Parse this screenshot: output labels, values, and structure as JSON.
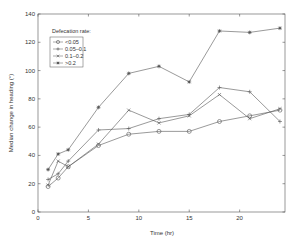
{
  "chart_data": {
    "type": "line",
    "title": "",
    "xlabel": "Time (hr)",
    "ylabel": "Median change in heading (°)",
    "xlim": [
      0,
      24.5
    ],
    "ylim": [
      0,
      140
    ],
    "xticks": [
      0,
      5,
      10,
      15,
      20
    ],
    "yticks": [
      0,
      20,
      40,
      60,
      80,
      100,
      120,
      140
    ],
    "grid": false,
    "legend_title": "Defecation rate:",
    "legend_position": "upper left",
    "x": [
      1,
      2,
      3,
      6,
      9,
      12,
      15,
      18,
      21,
      24
    ],
    "series": [
      {
        "name": "<0.05",
        "marker": "circle",
        "values": [
          18,
          24,
          32,
          47,
          55,
          57,
          57,
          64,
          68,
          72
        ]
      },
      {
        "name": "0.05–0.1",
        "marker": "plus",
        "values": [
          23,
          27,
          36,
          58,
          59,
          66,
          69,
          88,
          85,
          64
        ]
      },
      {
        "name": "0.1–0.2",
        "marker": "x",
        "values": [
          19,
          36,
          32,
          48,
          72,
          63,
          68,
          83,
          66,
          73
        ]
      },
      {
        "name": ">0.2",
        "marker": "asterisk",
        "values": [
          30,
          41,
          44,
          74,
          98,
          103,
          92,
          128,
          127,
          130
        ]
      }
    ]
  },
  "colors": {
    "line": "#555555",
    "axis": "#555555",
    "text": "#333333"
  }
}
